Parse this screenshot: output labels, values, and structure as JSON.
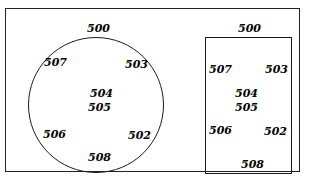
{
  "figure": {
    "kind": "patent-reference-figure",
    "background_color": "#ffffff",
    "line_color": "#1a1a1a",
    "text_color": "#000000",
    "outer_frame": {
      "name": "outer-frame",
      "shape": "rectangle"
    },
    "panels": [
      {
        "id": "left-panel",
        "shape": "circle",
        "labels": {
          "top": "500",
          "upper_left": "507",
          "upper_right": "503",
          "center_upper": "504",
          "center_lower": "505",
          "lower_left": "506",
          "lower_right": "502",
          "bottom": "508"
        }
      },
      {
        "id": "right-panel",
        "shape": "rectangle",
        "labels": {
          "top": "500",
          "upper_left": "507",
          "upper_right": "503",
          "center_upper": "504",
          "center_lower": "505",
          "lower_left": "506",
          "lower_right": "502",
          "bottom": "508"
        }
      }
    ]
  }
}
